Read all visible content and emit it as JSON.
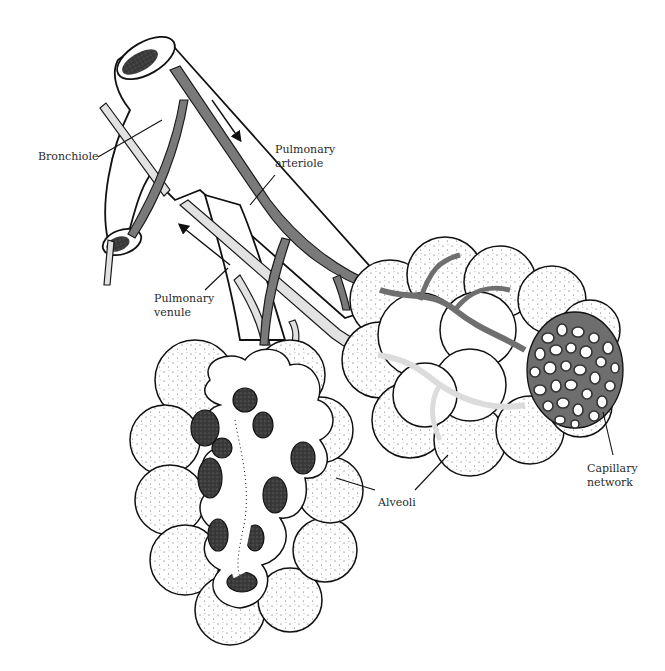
{
  "figure": {
    "labels": {
      "bronchiole": "Bronchiole",
      "pulmonary_arteriole_line1": "Pulmonary",
      "pulmonary_arteriole_line2": "arteriole",
      "pulmonary_venule_line1": "Pulmonary",
      "pulmonary_venule_line2": "venule",
      "alveoli": "Alveoli",
      "capillary_network_line1": "Capillary",
      "capillary_network_line2": "network"
    },
    "colors": {
      "ink": "#111111",
      "arteriole": "#7a7a7a",
      "venule": "#e2e2e2",
      "background": "#ffffff"
    },
    "arrows": {
      "arteriole_flow": "down-right (into lung)",
      "venule_flow": "up-left (out of lung)"
    }
  }
}
